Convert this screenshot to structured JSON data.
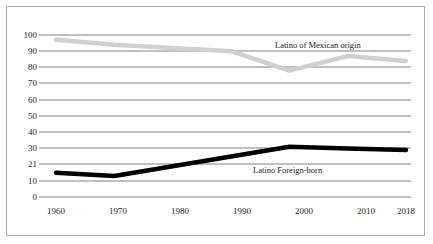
{
  "chart_data": {
    "type": "line",
    "title": "",
    "subtitle": "",
    "xlabel": "",
    "ylabel": "",
    "x": [
      "1960",
      "1970",
      "1980",
      "1990",
      "2000",
      "2010",
      "2018"
    ],
    "categories": [
      "1960",
      "1970",
      "1980",
      "1990",
      "2000",
      "2010",
      "2018"
    ],
    "y_ticks": [
      "0",
      "10",
      "21",
      "30",
      "40",
      "50",
      "60",
      "70",
      "80",
      "90",
      "100"
    ],
    "y_tick_values": [
      0,
      10,
      21,
      30,
      40,
      50,
      60,
      70,
      80,
      90,
      100
    ],
    "ylim": [
      0,
      100
    ],
    "grid": true,
    "legend_position": "inline-labels",
    "series": [
      {
        "name": "Latino of Mexican origin",
        "values": [
          97,
          94,
          92,
          90,
          78,
          87,
          84
        ],
        "color": "#d0d0d0",
        "line_width": 4.5,
        "label_x": "1995",
        "label_y": 94
      },
      {
        "name": "Latino Foreign-born",
        "values": [
          15,
          13,
          19,
          25,
          31,
          30,
          29
        ],
        "color": "#000000",
        "line_width": 4.5,
        "label_x": "2003",
        "label_y": 24
      }
    ]
  },
  "labels": {
    "series_mexican_origin": "Latino of Mexican origin",
    "series_foreign_born": "Latino Foreign-born"
  }
}
